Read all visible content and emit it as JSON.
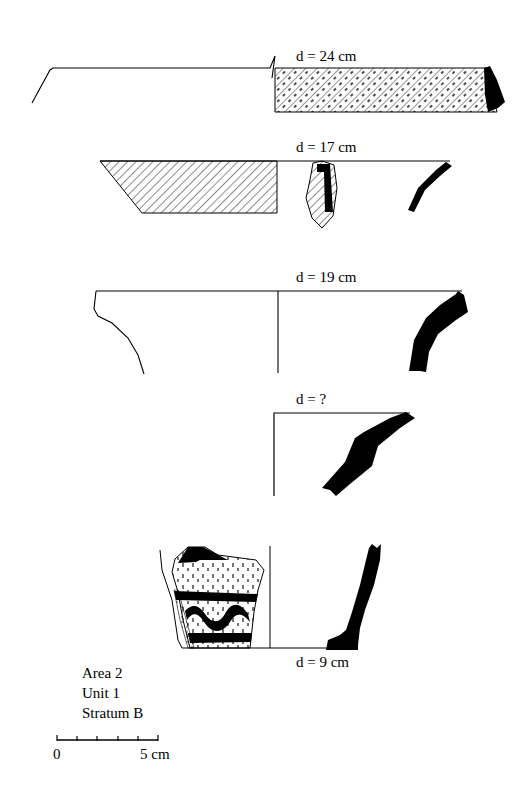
{
  "figure": {
    "type": "archaeological pottery profile drawing",
    "vessels": [
      {
        "id": 1,
        "diameter_label": "d = 24 cm",
        "section": "hatched with stipple",
        "profile": "flat rim, black tip"
      },
      {
        "id": 2,
        "diameter_label": "d = 17 cm",
        "section": "hatched",
        "profile": "curved black rim section"
      },
      {
        "id": 3,
        "diameter_label": "d = 19 cm",
        "section": "plain exterior outline",
        "profile": "flaring black rim section"
      },
      {
        "id": 4,
        "diameter_label": "d = ?",
        "section": "none",
        "profile": "angled black rim section"
      },
      {
        "id": 5,
        "diameter_label": "d = 9 cm",
        "section": "decorated sherd with stipple, bands and wavy line",
        "profile": "vertical black wall with base"
      }
    ],
    "context": {
      "area": "Area 2",
      "unit": "Unit 1",
      "stratum": "Stratum B"
    },
    "scale_bar": {
      "start_label": "0",
      "end_label": "5 cm",
      "ticks": 6
    }
  }
}
